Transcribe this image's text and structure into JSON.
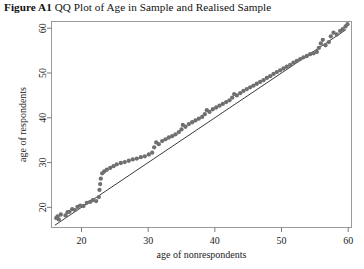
{
  "figure": {
    "number_label": "Figure A1",
    "caption_text": "QQ Plot of Age in Sample and Realised Sample"
  },
  "chart_data": {
    "type": "scatter",
    "xlabel": "age of nonrespondents",
    "ylabel": "age of respondents",
    "xlim": [
      15.5,
      60.5
    ],
    "ylim": [
      15.5,
      61.5
    ],
    "xticks": [
      20,
      30,
      40,
      50,
      60
    ],
    "yticks": [
      20,
      30,
      40,
      50,
      60
    ],
    "xtick_labels": [
      "20",
      "30",
      "40",
      "50",
      "60"
    ],
    "ytick_labels": [
      "20",
      "30",
      "40",
      "50",
      "60"
    ],
    "grid": false,
    "legend": "none",
    "marker": {
      "shape": "circle",
      "color": "#6f6f6f",
      "size_px": 4.3
    },
    "reference_line": {
      "description": "45-degree identity line y = x",
      "color": "#3b3b3b",
      "x": [
        16.0,
        59.7
      ],
      "y": [
        16.0,
        59.7
      ]
    },
    "annotations": [],
    "points": [
      [
        16.2,
        17.6
      ],
      [
        16.4,
        18.0
      ],
      [
        16.6,
        17.3
      ],
      [
        16.9,
        18.4
      ],
      [
        17.6,
        18.2
      ],
      [
        17.9,
        18.9
      ],
      [
        18.2,
        19.0
      ],
      [
        18.6,
        19.6
      ],
      [
        19.0,
        19.4
      ],
      [
        19.4,
        20.1
      ],
      [
        19.8,
        20.4
      ],
      [
        20.3,
        20.3
      ],
      [
        20.8,
        21.0
      ],
      [
        21.3,
        21.2
      ],
      [
        21.7,
        21.6
      ],
      [
        22.2,
        21.4
      ],
      [
        22.6,
        22.3
      ],
      [
        22.7,
        23.9
      ],
      [
        22.8,
        25.2
      ],
      [
        22.9,
        26.4
      ],
      [
        23.1,
        27.6
      ],
      [
        23.4,
        28.0
      ],
      [
        23.8,
        28.4
      ],
      [
        24.3,
        28.8
      ],
      [
        24.8,
        29.2
      ],
      [
        25.3,
        29.6
      ],
      [
        25.9,
        29.9
      ],
      [
        26.5,
        30.1
      ],
      [
        27.1,
        30.4
      ],
      [
        27.7,
        30.7
      ],
      [
        28.3,
        30.9
      ],
      [
        28.9,
        31.2
      ],
      [
        29.5,
        31.4
      ],
      [
        30.1,
        31.8
      ],
      [
        30.6,
        32.2
      ],
      [
        30.9,
        33.4
      ],
      [
        31.2,
        34.5
      ],
      [
        31.6,
        34.1
      ],
      [
        32.1,
        34.8
      ],
      [
        32.6,
        35.2
      ],
      [
        33.1,
        35.6
      ],
      [
        33.6,
        35.9
      ],
      [
        34.1,
        36.3
      ],
      [
        34.6,
        36.8
      ],
      [
        35.0,
        37.4
      ],
      [
        35.2,
        38.4
      ],
      [
        35.6,
        38.0
      ],
      [
        36.1,
        38.6
      ],
      [
        36.6,
        39.0
      ],
      [
        37.1,
        39.4
      ],
      [
        37.6,
        39.8
      ],
      [
        38.1,
        40.2
      ],
      [
        38.5,
        40.8
      ],
      [
        38.8,
        41.7
      ],
      [
        39.2,
        41.3
      ],
      [
        39.7,
        41.9
      ],
      [
        40.2,
        42.3
      ],
      [
        40.7,
        42.7
      ],
      [
        41.2,
        43.1
      ],
      [
        41.7,
        43.5
      ],
      [
        42.2,
        43.9
      ],
      [
        42.6,
        44.5
      ],
      [
        42.9,
        45.3
      ],
      [
        43.3,
        45.0
      ],
      [
        43.8,
        45.5
      ],
      [
        44.3,
        46.0
      ],
      [
        44.8,
        46.4
      ],
      [
        45.3,
        46.8
      ],
      [
        45.8,
        47.2
      ],
      [
        46.3,
        47.6
      ],
      [
        46.8,
        48.0
      ],
      [
        47.3,
        48.4
      ],
      [
        47.8,
        48.9
      ],
      [
        48.3,
        49.3
      ],
      [
        48.8,
        49.8
      ],
      [
        49.3,
        50.2
      ],
      [
        49.8,
        50.6
      ],
      [
        50.3,
        51.0
      ],
      [
        50.8,
        51.4
      ],
      [
        51.3,
        51.8
      ],
      [
        51.8,
        52.3
      ],
      [
        52.3,
        52.7
      ],
      [
        52.8,
        53.1
      ],
      [
        53.3,
        53.5
      ],
      [
        53.8,
        53.8
      ],
      [
        54.3,
        54.2
      ],
      [
        54.8,
        54.4
      ],
      [
        55.3,
        54.7
      ],
      [
        55.6,
        55.6
      ],
      [
        55.9,
        56.6
      ],
      [
        56.2,
        57.4
      ],
      [
        56.6,
        56.2
      ],
      [
        57.1,
        56.9
      ],
      [
        57.4,
        58.2
      ],
      [
        57.8,
        59.0
      ],
      [
        58.3,
        58.6
      ],
      [
        58.8,
        59.4
      ],
      [
        59.2,
        59.8
      ],
      [
        59.6,
        60.4
      ],
      [
        59.9,
        60.9
      ]
    ]
  }
}
